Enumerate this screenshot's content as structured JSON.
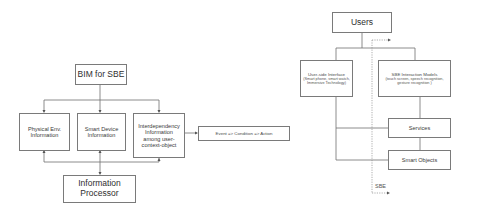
{
  "left_diagram": {
    "root": {
      "label": "BIM for SBE"
    },
    "children": [
      {
        "label": "Physical Env. Information"
      },
      {
        "label": "Smart Device Information"
      },
      {
        "label": "Interdependency Information among user-context-object"
      }
    ],
    "rule": {
      "label": "Event => Condition => Action"
    },
    "sink": {
      "label": "Information Processor"
    }
  },
  "right_diagram": {
    "top": {
      "label": "Users"
    },
    "interface": {
      "title": "User-side Interface",
      "detail": "(Smart phone, smart watch, Immersive Technology)"
    },
    "interaction": {
      "title": "SBE Interaction Models",
      "detail": "(touch screen, speech recognition, gesture recognition )"
    },
    "services": {
      "label": "Services"
    },
    "objects": {
      "label": "Smart Objects"
    },
    "boundary": {
      "label": "SBE"
    }
  },
  "colors": {
    "line": "#6e6e6e",
    "border": "#7a7a7a",
    "text": "#333333"
  }
}
